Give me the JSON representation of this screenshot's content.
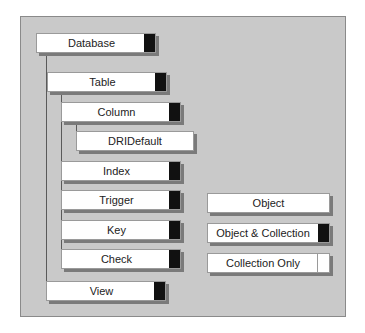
{
  "diagram": {
    "hierarchy": [
      {
        "id": "database",
        "label": "Database",
        "tab": "collection",
        "level": 0
      },
      {
        "id": "table",
        "label": "Table",
        "tab": "collection",
        "level": 1
      },
      {
        "id": "column",
        "label": "Column",
        "tab": "collection",
        "level": 2
      },
      {
        "id": "dridefault",
        "label": "DRIDefault",
        "tab": "none",
        "level": 3
      },
      {
        "id": "index",
        "label": "Index",
        "tab": "collection",
        "level": 2
      },
      {
        "id": "trigger",
        "label": "Trigger",
        "tab": "collection",
        "level": 2
      },
      {
        "id": "key",
        "label": "Key",
        "tab": "collection",
        "level": 2
      },
      {
        "id": "check",
        "label": "Check",
        "tab": "collection",
        "level": 2
      },
      {
        "id": "view",
        "label": "View",
        "tab": "collection",
        "level": 1
      }
    ],
    "legend": [
      {
        "id": "object",
        "label": "Object",
        "tab": "none"
      },
      {
        "id": "object-collection",
        "label": "Object & Collection",
        "tab": "filled"
      },
      {
        "id": "collection-only",
        "label": "Collection Only",
        "tab": "empty"
      }
    ],
    "colors": {
      "panel": "#c9c9c9",
      "box": "#ffffff",
      "tab": "#111111",
      "shadow": "#7a7a7a"
    }
  }
}
